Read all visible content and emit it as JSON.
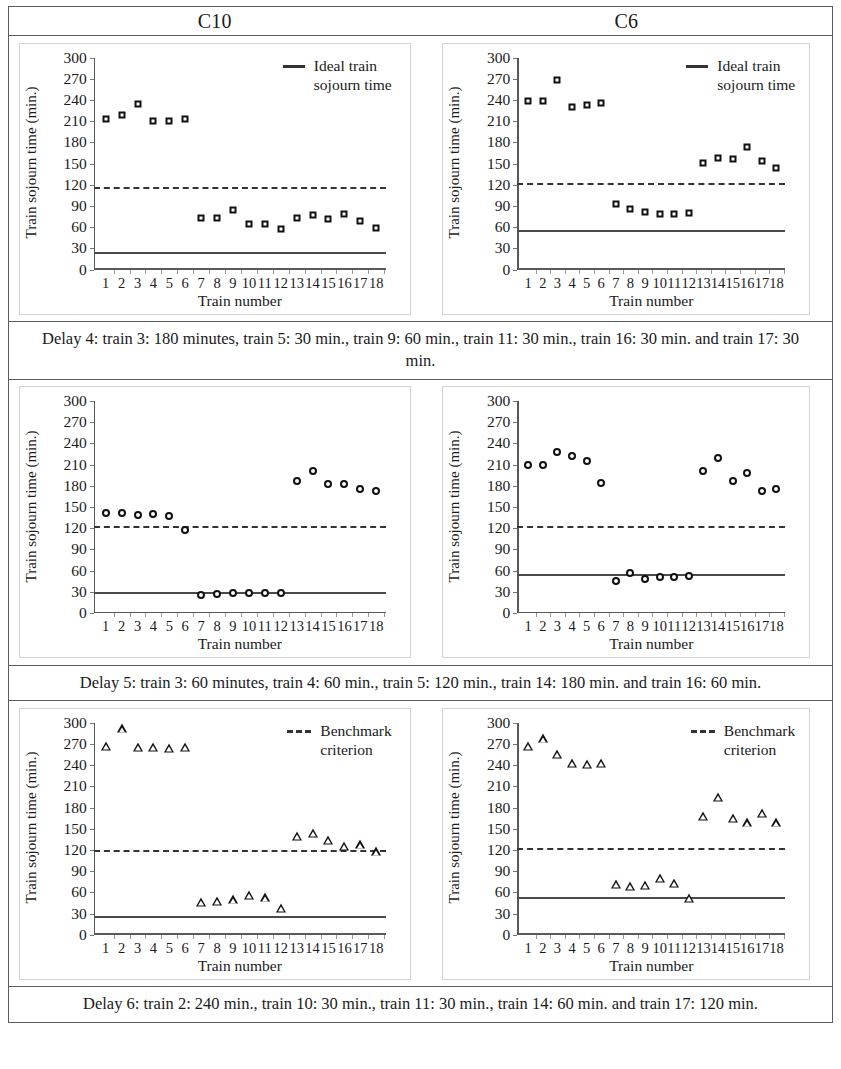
{
  "header": {
    "left": "C10",
    "right": "C6"
  },
  "axis": {
    "ylabel": "Train sojourn time (min.)",
    "xlabel": "Train number",
    "yticks": [
      "0",
      "30",
      "60",
      "90",
      "120",
      "150",
      "180",
      "210",
      "240",
      "270",
      "300"
    ],
    "ymin": 0,
    "ymax": 300,
    "xticks": [
      "1",
      "2",
      "3",
      "4",
      "5",
      "6",
      "7",
      "8",
      "9",
      "10",
      "11",
      "12",
      "13",
      "14",
      "15",
      "16",
      "17",
      "18"
    ]
  },
  "legends": {
    "ideal": {
      "line_style": "solid",
      "label_line1": "Ideal train",
      "label_line2": "sojourn time"
    },
    "benchmark": {
      "line_style": "dashed",
      "label_line1": "Benchmark",
      "label_line2": "criterion"
    }
  },
  "captions": {
    "row1": "Delay 4: train 3: 180 minutes, train 5: 30 min., train 9: 60 min., train 11: 30 min., train 16: 30 min. and train 17: 30 min.",
    "row2": "Delay 5: train 3: 60 minutes, train 4: 60 min., train 5: 120 min., train 14: 180 min. and train 16: 60 min.",
    "row3": "Delay 6: train 2: 240 min., train 10: 30 min., train 11: 30 min., train 14: 60 min. and train 17: 120 min."
  },
  "chart_data": [
    {
      "id": "delay4-c10",
      "type": "scatter",
      "title": "C10",
      "marker": "square",
      "xlabel": "Train number",
      "ylabel": "Train sojourn time (min.)",
      "ylim": [
        0,
        300
      ],
      "ytick_step": 30,
      "grid": false,
      "legend": "ideal",
      "legend_position": "top-right",
      "x": [
        1,
        2,
        3,
        4,
        5,
        6,
        7,
        8,
        9,
        10,
        11,
        12,
        13,
        14,
        15,
        16,
        17,
        18
      ],
      "values": [
        213,
        218,
        234,
        210,
        210,
        213,
        73,
        73,
        84,
        64,
        64,
        57,
        73,
        77,
        71,
        79,
        69,
        59
      ],
      "ideal_line": 24,
      "benchmark_line": 117
    },
    {
      "id": "delay4-c6",
      "type": "scatter",
      "title": "C6",
      "marker": "square",
      "xlabel": "Train number",
      "ylabel": "Train sojourn time (min.)",
      "ylim": [
        0,
        300
      ],
      "ytick_step": 30,
      "grid": false,
      "legend": "ideal",
      "legend_position": "top-right",
      "x": [
        1,
        2,
        3,
        4,
        5,
        6,
        7,
        8,
        9,
        10,
        11,
        12,
        13,
        14,
        15,
        16,
        17,
        18
      ],
      "values": [
        239,
        239,
        268,
        230,
        233,
        236,
        92,
        86,
        81,
        79,
        78,
        80,
        151,
        158,
        156,
        174,
        154,
        143
      ],
      "ideal_line": 54,
      "benchmark_line": 123
    },
    {
      "id": "delay5-c10",
      "type": "scatter",
      "title": "C10",
      "marker": "circle",
      "xlabel": "Train number",
      "ylabel": "Train sojourn time (min.)",
      "ylim": [
        0,
        300
      ],
      "ytick_step": 30,
      "grid": false,
      "legend": null,
      "x": [
        1,
        2,
        3,
        4,
        5,
        6,
        7,
        8,
        9,
        10,
        11,
        12,
        13,
        14,
        15,
        16,
        17,
        18
      ],
      "values": [
        141,
        141,
        139,
        140,
        138,
        118,
        26,
        27,
        29,
        28,
        28,
        29,
        187,
        201,
        182,
        182,
        175,
        172
      ],
      "ideal_line": 28,
      "benchmark_line": 123
    },
    {
      "id": "delay5-c6",
      "type": "scatter",
      "title": "C6",
      "marker": "circle",
      "xlabel": "Train number",
      "ylabel": "Train sojourn time (min.)",
      "ylim": [
        0,
        300
      ],
      "ytick_step": 30,
      "grid": false,
      "legend": null,
      "x": [
        1,
        2,
        3,
        4,
        5,
        6,
        7,
        8,
        9,
        10,
        11,
        12,
        13,
        14,
        15,
        16,
        17,
        18
      ],
      "values": [
        210,
        210,
        228,
        222,
        215,
        184,
        46,
        57,
        48,
        51,
        51,
        52,
        201,
        219,
        187,
        198,
        173,
        176
      ],
      "ideal_line": 54,
      "benchmark_line": 123
    },
    {
      "id": "delay6-c10",
      "type": "scatter",
      "title": "C10",
      "marker": "triangle",
      "xlabel": "Train number",
      "ylabel": "Train sojourn time (min.)",
      "ylim": [
        0,
        300
      ],
      "ytick_step": 30,
      "grid": false,
      "legend": "benchmark",
      "legend_position": "top-right",
      "x": [
        1,
        2,
        3,
        4,
        5,
        6,
        7,
        8,
        9,
        10,
        11,
        12,
        13,
        14,
        15,
        16,
        17,
        18
      ],
      "values": [
        267,
        292,
        266,
        266,
        265,
        266,
        47,
        48,
        50,
        56,
        53,
        38,
        140,
        144,
        134,
        126,
        128,
        118
      ],
      "ideal_line": 25,
      "benchmark_line": 120
    },
    {
      "id": "delay6-c6",
      "type": "scatter",
      "title": "C6",
      "marker": "triangle",
      "xlabel": "Train number",
      "ylabel": "Train sojourn time (min.)",
      "ylim": [
        0,
        300
      ],
      "ytick_step": 30,
      "grid": false,
      "legend": "benchmark",
      "legend_position": "top-right",
      "x": [
        1,
        2,
        3,
        4,
        5,
        6,
        7,
        8,
        9,
        10,
        11,
        12,
        13,
        14,
        15,
        16,
        17,
        18
      ],
      "values": [
        267,
        278,
        256,
        243,
        242,
        243,
        72,
        69,
        71,
        81,
        73,
        52,
        168,
        195,
        165,
        159,
        173,
        159
      ],
      "ideal_line": 52,
      "benchmark_line": 123
    }
  ]
}
